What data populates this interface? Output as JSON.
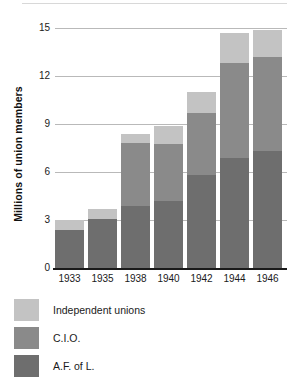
{
  "chart_data": {
    "type": "bar",
    "subtype": "stacked-bar",
    "title": "",
    "xlabel": "",
    "ylabel": "Millions of union members",
    "ylim": [
      0,
      15
    ],
    "yticks": [
      0,
      3,
      6,
      9,
      12,
      15
    ],
    "ytick_labels": [
      "0",
      "3",
      "6",
      "9",
      "12",
      "15"
    ],
    "grid": true,
    "grid_axis": "y",
    "legend_position": "below",
    "categories": [
      "1933",
      "1935",
      "1938",
      "1940",
      "1942",
      "1944",
      "1946"
    ],
    "series": [
      {
        "name": "A.F. of L.",
        "color": "#6e6e6e",
        "values": [
          2.4,
          3.05,
          3.9,
          4.2,
          5.8,
          6.9,
          7.3
        ]
      },
      {
        "name": "C.I.O.",
        "color": "#8a8a8a",
        "values": [
          0.0,
          0.0,
          3.9,
          3.55,
          3.9,
          5.9,
          5.9
        ]
      },
      {
        "name": "Independent unions",
        "color": "#c3c3c3",
        "values": [
          0.6,
          0.65,
          0.6,
          1.15,
          1.3,
          1.9,
          1.7
        ]
      }
    ],
    "totals": [
      3.0,
      3.7,
      8.4,
      8.9,
      11.0,
      14.7,
      14.9
    ]
  },
  "legend": {
    "items": [
      {
        "label": "Independent unions",
        "color": "#c3c3c3"
      },
      {
        "label": "C.I.O.",
        "color": "#8a8a8a"
      },
      {
        "label": "A.F. of L.",
        "color": "#6e6e6e"
      }
    ]
  },
  "colors": {
    "independent": "#c3c3c3",
    "cio": "#8a8a8a",
    "afl": "#6e6e6e",
    "gridline": "#b9b9b9",
    "axis": "#1a1a1a",
    "text": "#1a1a1a",
    "background": "#ffffff"
  }
}
